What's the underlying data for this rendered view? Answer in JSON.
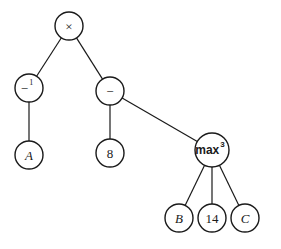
{
  "diagram": {
    "type": "expression-tree",
    "nodes": [
      {
        "id": "times",
        "label": "×",
        "sup": "",
        "x": 69,
        "y": 26,
        "r": 14,
        "style": "serif"
      },
      {
        "id": "inv",
        "label": "−",
        "sup": "1",
        "x": 29,
        "y": 88,
        "r": 14,
        "style": "serif"
      },
      {
        "id": "minus",
        "label": "−",
        "sup": "",
        "x": 110,
        "y": 91,
        "r": 14,
        "style": "serif"
      },
      {
        "id": "A",
        "label": "A",
        "sup": "",
        "x": 29,
        "y": 155,
        "r": 14,
        "style": "italic"
      },
      {
        "id": "eight",
        "label": "8",
        "sup": "",
        "x": 110,
        "y": 153,
        "r": 14,
        "style": "serif"
      },
      {
        "id": "max",
        "label": "max",
        "sup": "3",
        "x": 212,
        "y": 150,
        "r": 17,
        "style": "sans"
      },
      {
        "id": "B",
        "label": "B",
        "sup": "",
        "x": 179,
        "y": 218,
        "r": 14,
        "style": "italic"
      },
      {
        "id": "fourteen",
        "label": "14",
        "sup": "",
        "x": 212,
        "y": 218,
        "r": 14,
        "style": "serif"
      },
      {
        "id": "C",
        "label": "C",
        "sup": "",
        "x": 245,
        "y": 218,
        "r": 14,
        "style": "italic"
      }
    ],
    "edges": [
      [
        "times",
        "inv"
      ],
      [
        "times",
        "minus"
      ],
      [
        "inv",
        "A"
      ],
      [
        "minus",
        "eight"
      ],
      [
        "minus",
        "max"
      ],
      [
        "max",
        "B"
      ],
      [
        "max",
        "fourteen"
      ],
      [
        "max",
        "C"
      ]
    ]
  }
}
